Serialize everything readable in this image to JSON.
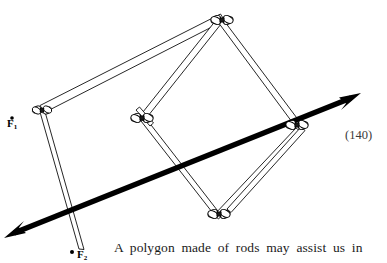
{
  "page": {
    "page_number": "(140)",
    "background_color": "#ffffff",
    "ink_color": "#000000"
  },
  "caption": {
    "text": "A polygon made of rods may assist us in"
  },
  "figure": {
    "rod_color": "#000000",
    "rod_fill": "#ffffff",
    "arrow_color": "#000000",
    "joints": [
      {
        "id": "top",
        "label": "top-joint",
        "x": 222,
        "y": 20
      },
      {
        "id": "left",
        "label": "left-joint",
        "x": 42,
        "y": 110
      },
      {
        "id": "mid-left",
        "label": "mid-left-joint",
        "x": 142,
        "y": 118
      },
      {
        "id": "right",
        "label": "right-joint",
        "x": 297,
        "y": 125
      },
      {
        "id": "bottom",
        "label": "bottom-joint",
        "x": 216,
        "y": 217
      }
    ],
    "rods": [
      {
        "id": "rod-left-top",
        "from": "left",
        "to": "top"
      },
      {
        "id": "rod-top-midleft",
        "from": "top",
        "to": "mid-left"
      },
      {
        "id": "rod-top-right",
        "from": "top",
        "to": "right"
      },
      {
        "id": "rod-left-bottom-ext",
        "from": "left",
        "to": "bottom-free-end"
      },
      {
        "id": "rod-midleft-free",
        "from": "mid-left",
        "to": "lower-free-end"
      },
      {
        "id": "rod-midleft-bottom",
        "from": "mid-left",
        "to": "bottom"
      },
      {
        "id": "rod-right-bottom",
        "from": "right",
        "to": "bottom"
      }
    ],
    "free_ends": [
      {
        "id": "bottom-free-end",
        "x": 229,
        "y": 212
      },
      {
        "id": "lower-free-end",
        "x": 82,
        "y": 252
      }
    ],
    "force_arrow": {
      "name": "double-headed-force-arrow",
      "start_x": 6,
      "start_y": 236,
      "end_x": 359,
      "end_y": 94,
      "double_headed": true
    },
    "labels": [
      {
        "id": "f1",
        "base": "F",
        "subscript": "1"
      },
      {
        "id": "f2",
        "base": "F",
        "subscript": "2"
      }
    ]
  }
}
